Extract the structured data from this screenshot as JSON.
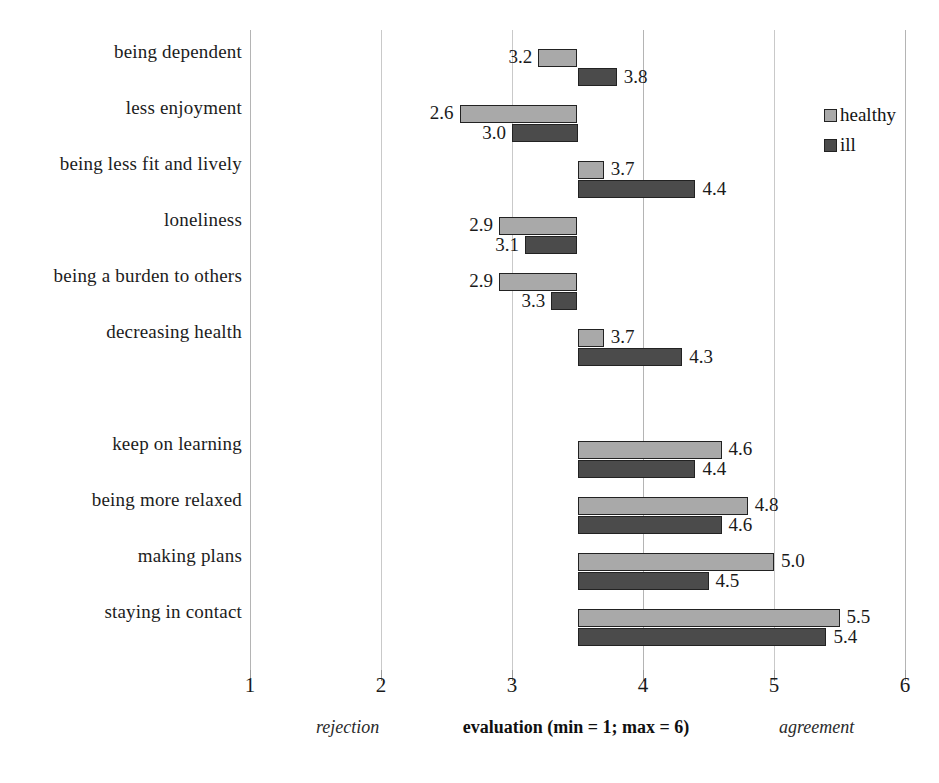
{
  "chart_data": {
    "type": "bar",
    "orientation": "horizontal",
    "title": "",
    "xlabel": "evaluation (min = 1; max = 6)",
    "ylabel": "",
    "xlim": [
      1,
      6
    ],
    "baseline": 3.5,
    "grid": true,
    "legend_position": "top-right",
    "xticks": [
      "1",
      "2",
      "3",
      "4",
      "5",
      "6"
    ],
    "xtick_values": [
      1,
      2,
      3,
      4,
      5,
      6
    ],
    "categories": [
      "being dependent",
      "less enjoyment",
      "being less fit and lively",
      "loneliness",
      "being a burden to others",
      "decreasing health",
      "",
      "keep on learning",
      "being more relaxed",
      "making plans",
      "staying in contact"
    ],
    "series": [
      {
        "name": "healthy",
        "color": "#a9a9a9",
        "values": [
          3.2,
          2.6,
          3.7,
          2.9,
          2.9,
          3.7,
          null,
          4.6,
          4.8,
          5.0,
          5.5
        ]
      },
      {
        "name": "ill",
        "color": "#4b4b4b",
        "values": [
          3.8,
          3.0,
          4.4,
          3.1,
          3.3,
          4.3,
          null,
          4.4,
          4.6,
          4.5,
          5.4
        ]
      }
    ],
    "value_labels": {
      "healthy": [
        "3.2",
        "2.6",
        "3.7",
        "2.9",
        "2.9",
        "3.7",
        "",
        "4.6",
        "4.8",
        "5.0",
        "5.5"
      ],
      "ill": [
        "3.8",
        "3.0",
        "4.4",
        "3.1",
        "3.3",
        "4.3",
        "",
        "4.4",
        "4.6",
        "4.5",
        "5.4"
      ]
    },
    "annotations": {
      "left_anchor": "rejection",
      "right_anchor": "agreement"
    }
  },
  "legend": {
    "items": [
      {
        "label": "healthy",
        "color": "#a9a9a9",
        "icon": "legend-swatch-icon"
      },
      {
        "label": "ill",
        "color": "#4b4b4b",
        "icon": "legend-swatch-icon"
      }
    ]
  },
  "axis": {
    "x_caption": "evaluation (min = 1; max = 6)",
    "left_caption": "rejection",
    "right_caption": "agreement"
  }
}
